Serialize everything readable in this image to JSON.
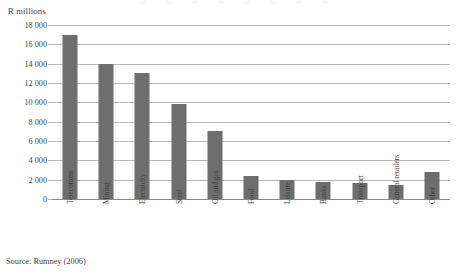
{
  "figure": {
    "source_note": "Source: Rumney (2006)",
    "y_axis_unit": "R millions",
    "bar_color": "#6e6e6e",
    "gridline_color": "#b9b9b9",
    "text_color": "#3f3f3f",
    "background": "#ffffff"
  },
  "chart_data": {
    "type": "bar",
    "title": "",
    "subtitle": "",
    "xlabel": "",
    "ylabel": "R millions",
    "ylim": [
      0,
      18000
    ],
    "ytick_step": 2000,
    "grid": true,
    "legend": false,
    "categories": [
      "Telecomms",
      "Mining",
      "Electricity",
      "Steel",
      "Oil and gas",
      "Food",
      "Leisure",
      "Banks",
      "Transport",
      "General retailers",
      "Other"
    ],
    "values": [
      17000,
      14000,
      13000,
      9800,
      7000,
      2400,
      2000,
      1750,
      1700,
      1400,
      2800
    ],
    "ytick_labels": [
      "18 000",
      "16 000",
      "14 000",
      "12 000",
      "10 000",
      "8 000",
      "6 000",
      "4 000",
      "2 000",
      "0"
    ],
    "ytick_values": [
      18000,
      16000,
      14000,
      12000,
      10000,
      8000,
      6000,
      4000,
      2000,
      0
    ]
  }
}
